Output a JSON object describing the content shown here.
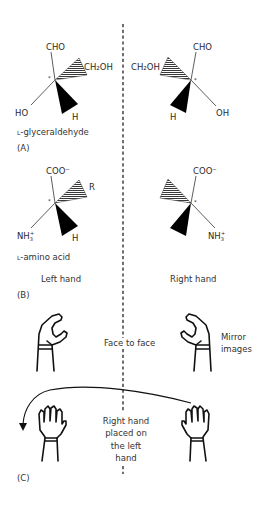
{
  "figure": {
    "panels": {
      "A": {
        "label": "(A)",
        "left_molecule": {
          "top_group": "CHO",
          "hatched_group": "CH₂OH",
          "left_group": "HO",
          "wedge_group": "H",
          "stereocenter_mark": "*",
          "name": "L-glyceraldehyde",
          "name_prefix": "L",
          "name_rest": "-glyceraldehyde"
        },
        "right_molecule": {
          "top_group": "CHO",
          "hatched_group": "CH₂OH",
          "right_group": "OH",
          "wedge_group": "H",
          "stereocenter_mark": "*"
        }
      },
      "B": {
        "label": "(B)",
        "left_molecule": {
          "top_group": "COO⁻",
          "hatched_group": "R",
          "left_group": "NH₃⁺",
          "left_group_base": "NH",
          "left_group_sub": "3",
          "left_group_sup": "+",
          "wedge_group": "H",
          "stereocenter_mark": "*",
          "name": "L-amino acid",
          "name_prefix": "L",
          "name_rest": "-amino acid",
          "caption": "Left hand"
        },
        "right_molecule": {
          "top_group": "COO⁻",
          "right_group": "NH₃⁺",
          "right_group_base": "NH",
          "right_group_sub": "3",
          "right_group_sup": "+",
          "stereocenter_mark": "*",
          "caption": "Right hand"
        }
      },
      "C": {
        "label": "(C)",
        "top_row": {
          "center_caption": "Face to face",
          "right_caption_line1": "Mirror",
          "right_caption_line2": "images"
        },
        "bottom_row": {
          "center_caption_lines": [
            "Right hand",
            "placed on",
            "the left",
            "hand"
          ]
        }
      }
    },
    "icons": [
      "left-hand-cupped-icon",
      "right-hand-cupped-icon",
      "left-hand-open-icon",
      "right-hand-open-icon",
      "curved-arrow-icon"
    ],
    "colors": {
      "text": "#2a2a2a",
      "line": "#222222",
      "background": "#ffffff"
    }
  }
}
